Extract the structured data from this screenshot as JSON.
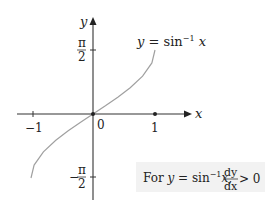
{
  "diagram": {
    "type": "function-graph",
    "function_label": {
      "prefix": "y = sin",
      "exponent": "−1",
      "suffix": " x"
    },
    "axes": {
      "x_label": "x",
      "y_label": "y",
      "x_ticks": [
        {
          "value": -1,
          "label": "−1"
        },
        {
          "value": 1,
          "label": "1"
        }
      ],
      "y_ticks": [
        {
          "value": "π/2",
          "num": "π",
          "den": "2",
          "sign": ""
        },
        {
          "value": "−π/2",
          "num": "π",
          "den": "2",
          "sign": "−"
        }
      ],
      "origin_label": "0"
    },
    "curve": {
      "domain": [
        -1,
        1
      ],
      "range": [
        "-π/2",
        "π/2"
      ],
      "color": "#a0a0a0",
      "points_px": [
        [
          31,
          178
        ],
        [
          34.1,
          165.1
        ],
        [
          43.4,
          151.8
        ],
        [
          55.8,
          140.2
        ],
        [
          68.2,
          130.8
        ],
        [
          80.6,
          122.2
        ],
        [
          93,
          114
        ],
        [
          105.4,
          105.8
        ],
        [
          117.8,
          97.2
        ],
        [
          130.2,
          87.8
        ],
        [
          142.6,
          76.2
        ],
        [
          151.9,
          62.9
        ],
        [
          155,
          50
        ]
      ]
    },
    "note": {
      "text_for": "For ",
      "y": "y",
      "eq": " = sin",
      "exp": "−1",
      "x": "x,",
      "frac_num": "dy",
      "frac_den": "dx",
      "relation": " > 0",
      "background": "#f2f2f2"
    }
  }
}
